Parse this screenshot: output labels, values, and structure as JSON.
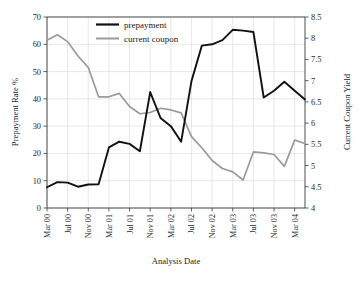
{
  "chart_data": {
    "type": "line",
    "title": "",
    "xlabel": "Analysis Date",
    "ylabel": "Prepayment Rate %",
    "y2label": "Current Coupon Yield",
    "grid": true,
    "legend_position": "top-center",
    "ylim": [
      0,
      70
    ],
    "y2lim": [
      4,
      8.5
    ],
    "yticks": [
      "0",
      "10",
      "20",
      "30",
      "40",
      "50",
      "60",
      "70"
    ],
    "y2ticks": [
      "4",
      "4.5",
      "5",
      "5.5",
      "6",
      "6.5",
      "7",
      "7.5",
      "8",
      "8.5"
    ],
    "xtick_labels": [
      "Mar 00",
      "Jul 00",
      "Nov 00",
      "Mar 01",
      "Jul 01",
      "Nov 01",
      "Mar 02",
      "Jul 02",
      "Nov 02",
      "Mar 03",
      "Jul 03",
      "Nov 03",
      "Mar 04"
    ],
    "x": [
      "Mar 00",
      "May 00",
      "Jul 00",
      "Sep 00",
      "Nov 00",
      "Jan 01",
      "Mar 01",
      "May 01",
      "Jul 01",
      "Sep 01",
      "Nov 01",
      "Jan 02",
      "Mar 02",
      "May 02",
      "Jul 02",
      "Sep 02",
      "Nov 02",
      "Jan 03",
      "Mar 03",
      "May 03",
      "Jul 03",
      "Sep 03",
      "Nov 03",
      "Jan 04",
      "Mar 04",
      "May 04"
    ],
    "series": [
      {
        "name": "prepayment",
        "axis": "left",
        "color": "#111111",
        "values": [
          7.6,
          9.5,
          9.3,
          7.8,
          8.6,
          8.7,
          22.2,
          24.3,
          23.5,
          20.8,
          42.5,
          33.0,
          30.0,
          24.3,
          46.5,
          59.5,
          60.0,
          61.5,
          65.3,
          65.0,
          64.5,
          40.5,
          43.0,
          46.3,
          43.0,
          39.8
        ]
      },
      {
        "name": "current coupon",
        "axis": "right",
        "color": "#9a9a9a",
        "values": [
          7.95,
          8.08,
          7.92,
          7.58,
          7.31,
          6.62,
          6.62,
          6.7,
          6.39,
          6.22,
          6.25,
          6.35,
          6.31,
          6.24,
          5.68,
          5.42,
          5.12,
          4.93,
          4.85,
          4.66,
          5.32,
          5.3,
          5.26,
          4.98,
          5.6,
          5.52
        ]
      }
    ]
  },
  "legend": {
    "items": [
      {
        "label": "prepayment",
        "color": "#111111"
      },
      {
        "label": "current coupon",
        "color": "#9a9a9a"
      }
    ]
  }
}
